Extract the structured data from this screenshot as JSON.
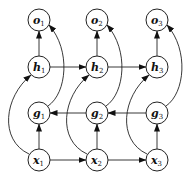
{
  "diagram": {
    "type": "bidirectional-recurrent-network",
    "nodes": [
      {
        "id": "o1",
        "label": "o",
        "sub": "1",
        "cx": 39,
        "cy": 20
      },
      {
        "id": "o2",
        "label": "o",
        "sub": "2",
        "cx": 97,
        "cy": 20
      },
      {
        "id": "o3",
        "label": "o",
        "sub": "3",
        "cx": 157,
        "cy": 20
      },
      {
        "id": "h1",
        "label": "h",
        "sub": "1",
        "cx": 39,
        "cy": 67
      },
      {
        "id": "h2",
        "label": "h",
        "sub": "2",
        "cx": 97,
        "cy": 67
      },
      {
        "id": "h3",
        "label": "h",
        "sub": "3",
        "cx": 157,
        "cy": 67
      },
      {
        "id": "g1",
        "label": "g",
        "sub": "1",
        "cx": 39,
        "cy": 113
      },
      {
        "id": "g2",
        "label": "g",
        "sub": "2",
        "cx": 97,
        "cy": 113
      },
      {
        "id": "g3",
        "label": "g",
        "sub": "3",
        "cx": 157,
        "cy": 113
      },
      {
        "id": "x1",
        "label": "x",
        "sub": "1",
        "cx": 39,
        "cy": 160
      },
      {
        "id": "x2",
        "label": "x",
        "sub": "2",
        "cx": 97,
        "cy": 160
      },
      {
        "id": "x3",
        "label": "x",
        "sub": "3",
        "cx": 157,
        "cy": 160
      }
    ],
    "edges": [
      {
        "from": "h1",
        "to": "o1"
      },
      {
        "from": "h2",
        "to": "o2"
      },
      {
        "from": "h3",
        "to": "o3"
      },
      {
        "from": "h1",
        "to": "h2"
      },
      {
        "from": "h2",
        "to": "h3"
      },
      {
        "from": "g3",
        "to": "g2"
      },
      {
        "from": "g2",
        "to": "g1"
      },
      {
        "from": "x1",
        "to": "g1"
      },
      {
        "from": "x2",
        "to": "g2"
      },
      {
        "from": "x3",
        "to": "g3"
      },
      {
        "from": "x1",
        "to": "x2"
      },
      {
        "from": "x2",
        "to": "x3"
      },
      {
        "from": "x1",
        "to": "h1",
        "curved": true
      },
      {
        "from": "x2",
        "to": "h2",
        "curved": true
      },
      {
        "from": "x3",
        "to": "h3",
        "curved": true
      },
      {
        "from": "g1",
        "to": "o1",
        "curved": true
      },
      {
        "from": "g2",
        "to": "o2",
        "curved": true
      },
      {
        "from": "g3",
        "to": "o3",
        "curved": true
      }
    ]
  }
}
